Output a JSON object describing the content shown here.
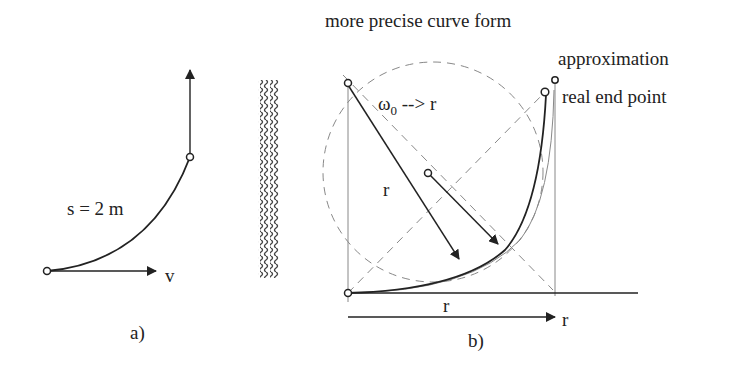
{
  "diagram": {
    "panel_a": {
      "caption": "a)",
      "arc_label": "s = 2 m",
      "velocity_label": "v"
    },
    "panel_b": {
      "caption": "b)",
      "title": "more precise curve form",
      "approx_label": "approximation",
      "real_end_label": "real end point",
      "omega_label_base": "ω",
      "omega_label_sub": "0",
      "omega_label_rest": " --> r",
      "radius_label_left": "r",
      "radius_label_bottom": "r",
      "axis_end_label": "r"
    },
    "colors": {
      "ink": "#222222",
      "construction": "#888888",
      "background": "#ffffff"
    }
  }
}
